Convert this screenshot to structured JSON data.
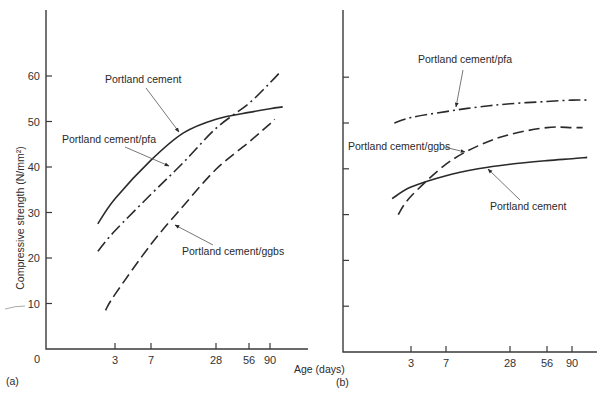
{
  "figure": {
    "x_axis_label": "Age (days)",
    "y_axis_label": "Compressive strength (N/mm²)",
    "panel_a_label": "(a)",
    "panel_b_label": "(b)",
    "y_ticks": [
      0,
      10,
      20,
      30,
      40,
      50,
      60
    ],
    "x_ticks": [
      3,
      7,
      28,
      56,
      90
    ],
    "origin_label": "0"
  },
  "chart_data": [
    {
      "type": "line",
      "panel": "(a)",
      "title": "",
      "xlabel": "Age (days)",
      "ylabel": "Compressive strength (N/mm²)",
      "x_scale": "log-like (ticks at 3, 7, 28, 56, 90)",
      "x_ticks": [
        3,
        7,
        28,
        56,
        90
      ],
      "y_ticks": [
        0,
        10,
        20,
        30,
        40,
        50,
        60
      ],
      "ylim": [
        0,
        74
      ],
      "grid": false,
      "legend": "inline annotations with arrows",
      "x": [
        2,
        3,
        7,
        14,
        28,
        56,
        90,
        120
      ],
      "series": [
        {
          "name": "Portland cement",
          "style": "solid",
          "points": [
            [
              2,
              27.5
            ],
            [
              3,
              33
            ],
            [
              7,
              41.5
            ],
            [
              14,
              47.5
            ],
            [
              28,
              50.5
            ],
            [
              56,
              52
            ],
            [
              90,
              52.8
            ],
            [
              120,
              53.2
            ]
          ]
        },
        {
          "name": "Portland cement/pfa",
          "style": "dash-dot",
          "points": [
            [
              2,
              21.5
            ],
            [
              3,
              26
            ],
            [
              7,
              34
            ],
            [
              14,
              41
            ],
            [
              28,
              48.5
            ],
            [
              56,
              54
            ],
            [
              90,
              58.5
            ],
            [
              115,
              61
            ]
          ]
        },
        {
          "name": "Portland cement/ggbs",
          "style": "dashed",
          "points": [
            [
              2.4,
              8.5
            ],
            [
              3,
              12
            ],
            [
              7,
              23
            ],
            [
              14,
              31.5
            ],
            [
              28,
              39.5
            ],
            [
              56,
              45.5
            ],
            [
              90,
              49.5
            ],
            [
              100,
              50.5
            ]
          ]
        }
      ],
      "annotations": [
        {
          "text": "Portland cement",
          "tx": 105,
          "ty": 83,
          "ax1": 146,
          "ay1": 88,
          "ax2": 179,
          "ay2": 132
        },
        {
          "text": "Portland cement/pfa",
          "tx": 62,
          "ty": 143,
          "ax1": 125,
          "ay1": 147,
          "ax2": 169,
          "ay2": 166
        },
        {
          "text": "Portland cement/ggbs",
          "tx": 182,
          "ty": 255,
          "ax1": 213,
          "ay1": 245,
          "ax2": 175,
          "ay2": 225
        }
      ]
    },
    {
      "type": "line",
      "panel": "(b)",
      "title": "",
      "xlabel": "Age (days)",
      "ylabel": "",
      "x_scale": "log-like (ticks at 3, 7, 28, 56, 90)",
      "x_ticks": [
        3,
        7,
        28,
        56,
        90
      ],
      "y_ticks": [
        0,
        10,
        20,
        30,
        40,
        50,
        60
      ],
      "ylim": [
        0,
        74
      ],
      "grid": false,
      "legend": "inline annotations with arrows",
      "series": [
        {
          "name": "Portland cement/pfa",
          "style": "dash-dot",
          "points": [
            [
              2,
              50
            ],
            [
              3,
              51.2
            ],
            [
              7,
              52.5
            ],
            [
              14,
              53.5
            ],
            [
              28,
              54.2
            ],
            [
              56,
              54.7
            ],
            [
              90,
              55
            ],
            [
              120,
              55
            ]
          ]
        },
        {
          "name": "Portland cement/ggbs",
          "style": "dashed",
          "points": [
            [
              2.2,
              30
            ],
            [
              3,
              34
            ],
            [
              7,
              41
            ],
            [
              14,
              45
            ],
            [
              28,
              47.5
            ],
            [
              56,
              49
            ],
            [
              90,
              49
            ],
            [
              110,
              49
            ]
          ]
        },
        {
          "name": "Portland cement",
          "style": "solid",
          "points": [
            [
              1.9,
              33.5
            ],
            [
              3,
              36
            ],
            [
              7,
              38.5
            ],
            [
              14,
              40
            ],
            [
              28,
              41
            ],
            [
              56,
              41.8
            ],
            [
              90,
              42.2
            ],
            [
              120,
              42.5
            ]
          ]
        }
      ],
      "annotations": [
        {
          "text": "Portland cement/pfa",
          "tx": 418,
          "ty": 63,
          "ax1": 463,
          "ay1": 70,
          "ax2": 456,
          "ay2": 107
        },
        {
          "text": "Portland cement/ggbs",
          "tx": 348,
          "ty": 150,
          "ax1": 444,
          "ay1": 147,
          "ax2": 465,
          "ay2": 152
        },
        {
          "text": "Portland cement",
          "tx": 490,
          "ty": 210,
          "ax1": 520,
          "ay1": 200,
          "ax2": 488,
          "ay2": 169
        }
      ]
    }
  ]
}
